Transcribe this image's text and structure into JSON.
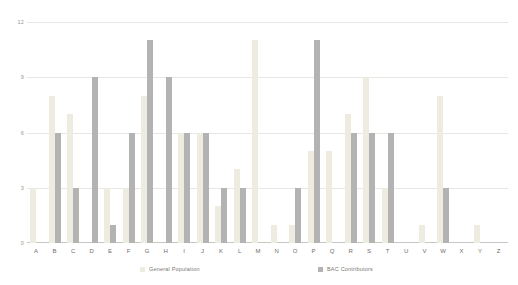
{
  "chart_data": {
    "type": "bar",
    "title": "",
    "subtitle": "",
    "xlabel": "",
    "ylabel": "",
    "ylim": [
      0,
      12
    ],
    "yticks": [
      "0",
      "3",
      "6",
      "9",
      "12"
    ],
    "grid": true,
    "legend_position": "bottom",
    "categories": [
      "A",
      "B",
      "C",
      "D",
      "E",
      "F",
      "G",
      "H",
      "I",
      "J",
      "K",
      "L",
      "M",
      "N",
      "O",
      "P",
      "Q",
      "R",
      "S",
      "T",
      "U",
      "V",
      "W",
      "X",
      "Y",
      "Z"
    ],
    "series": [
      {
        "name": "General Population",
        "color": "#eeebe1",
        "values": [
          3,
          8,
          7,
          0,
          3,
          3,
          8,
          0,
          6,
          6,
          2,
          4,
          11,
          1,
          1,
          5,
          5,
          7,
          9,
          3,
          0,
          1,
          8,
          0,
          1,
          0
        ]
      },
      {
        "name": "BAC Contributors",
        "color": "#b3b3b3",
        "values": [
          0,
          6,
          3,
          9,
          1,
          6,
          11,
          9,
          6,
          6,
          3,
          3,
          0,
          0,
          3,
          11,
          0,
          6,
          6,
          6,
          0,
          0,
          3,
          0,
          0,
          0
        ]
      }
    ]
  },
  "legend": {
    "items": [
      {
        "label": "General Population"
      },
      {
        "label": "BAC Contributors"
      }
    ]
  }
}
